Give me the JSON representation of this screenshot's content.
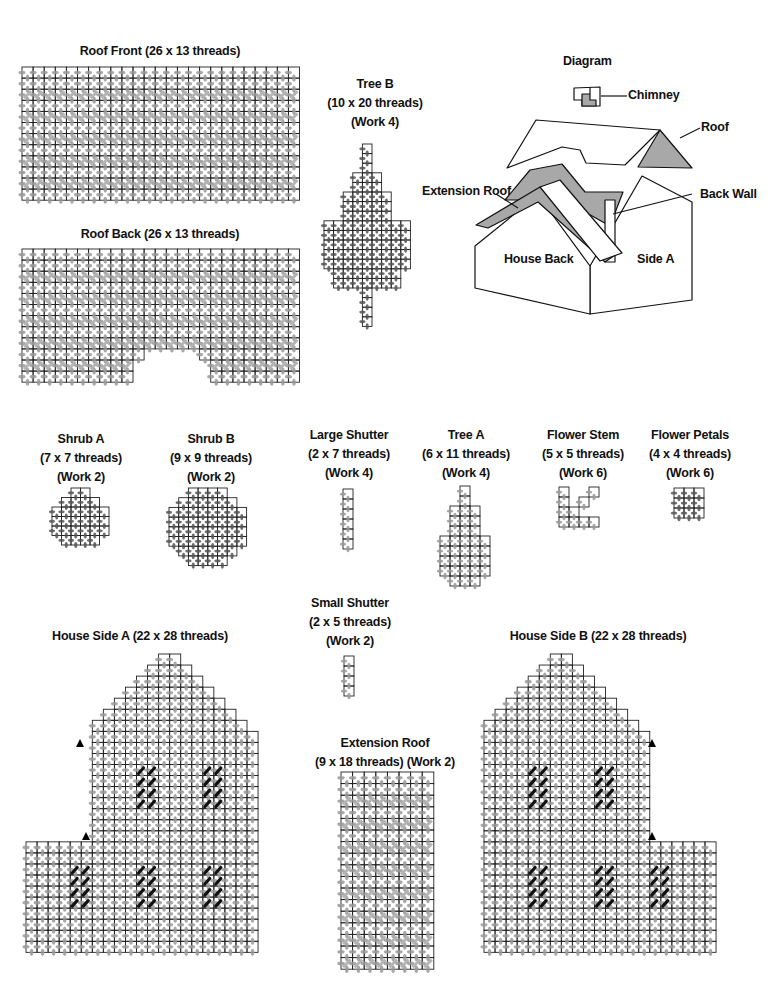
{
  "colors": {
    "grid_line": "#222222",
    "stitch_gray": "#9a9a9a",
    "stitch_dark": "#555555",
    "stitch_black": "#111111",
    "diagram_shade": "#a8a8a8"
  },
  "pieces": [
    {
      "id": "roof-front",
      "title": [
        "Roof Front (26 x 13 threads)"
      ],
      "label_x": 160,
      "label_y": 42,
      "grid": {
        "x": 22,
        "y": 67,
        "cell": 11.1,
        "cols": 25,
        "rows": 12,
        "shape": "rect",
        "hatched": true,
        "stitch": "gray"
      }
    },
    {
      "id": "roof-back",
      "title": [
        "Roof Back (26 x 13 threads)"
      ],
      "label_x": 160,
      "label_y": 225,
      "grid": {
        "x": 22,
        "y": 249,
        "cell": 11.1,
        "cols": 25,
        "rows": 12,
        "shape": "roofback",
        "hatched": true,
        "stitch": "gray"
      }
    },
    {
      "id": "tree-b",
      "title": [
        "Tree B",
        "(10 x 20 threads)",
        "(Work 4)"
      ],
      "label_x": 375,
      "label_y": 75,
      "grid": {
        "x": 324,
        "y": 144,
        "cell": 9.6,
        "cols": 9,
        "rows": 19,
        "shape": "treeb",
        "stitch": "dark"
      }
    },
    {
      "id": "shrub-a",
      "title": [
        "Shrub A",
        "(7 x 7 threads)",
        "(Work 2)"
      ],
      "label_x": 81,
      "label_y": 430,
      "grid": {
        "x": 52,
        "y": 488,
        "cell": 9.5,
        "cols": 6,
        "rows": 6,
        "shape": "shruba",
        "stitch": "dark"
      }
    },
    {
      "id": "shrub-b",
      "title": [
        "Shrub B",
        "(9 x 9 threads)",
        "(Work 2)"
      ],
      "label_x": 211,
      "label_y": 430,
      "grid": {
        "x": 169,
        "y": 488,
        "cell": 9.7,
        "cols": 8,
        "rows": 8,
        "shape": "shrubb",
        "stitch": "dark"
      }
    },
    {
      "id": "large-shutter",
      "title": [
        "Large Shutter",
        "(2 x 7 threads)",
        "(Work 4)"
      ],
      "label_x": 349,
      "label_y": 426,
      "grid": {
        "x": 343,
        "y": 489,
        "cell": 10,
        "cols": 1,
        "rows": 6,
        "shape": "rect",
        "stitch": "gray"
      }
    },
    {
      "id": "tree-a",
      "title": [
        "Tree A",
        "(6 x 11 threads)",
        "(Work 4)"
      ],
      "label_x": 466,
      "label_y": 426,
      "grid": {
        "x": 440,
        "y": 486,
        "cell": 10,
        "cols": 5,
        "rows": 10,
        "shape": "treea",
        "stitch": "gray"
      }
    },
    {
      "id": "flower-stem",
      "title": [
        "Flower Stem",
        "(5 x 5 threads)",
        "(Work 6)"
      ],
      "label_x": 583,
      "label_y": 426,
      "grid": {
        "x": 559,
        "y": 487,
        "cell": 10,
        "cols": 4,
        "rows": 4,
        "shape": "stem",
        "stitch": "gray"
      }
    },
    {
      "id": "flower-petals",
      "title": [
        "Flower Petals",
        "(4 x 4 threads)",
        "(Work 6)"
      ],
      "label_x": 690,
      "label_y": 426,
      "grid": {
        "x": 674,
        "y": 488,
        "cell": 10,
        "cols": 3,
        "rows": 3,
        "shape": "petals",
        "stitch": "dark"
      }
    },
    {
      "id": "small-shutter",
      "title": [
        "Small Shutter",
        "(2 x 5 threads)",
        "(Work 2)"
      ],
      "label_x": 350,
      "label_y": 594,
      "grid": {
        "x": 344,
        "y": 656,
        "cell": 10,
        "cols": 1,
        "rows": 4,
        "shape": "rect",
        "stitch": "gray"
      }
    },
    {
      "id": "extension-roof",
      "title": [
        "Extension Roof",
        "(9 x 18 threads) (Work 2)"
      ],
      "label_x": 385,
      "label_y": 734,
      "grid": {
        "x": 341,
        "y": 772,
        "cell": 11.6,
        "cols": 8,
        "rows": 17,
        "shape": "rect",
        "hatched": true,
        "stitch": "gray"
      }
    },
    {
      "id": "house-side-a",
      "title": [
        "House Side A (22 x 28 threads)"
      ],
      "label_x": 140,
      "label_y": 627,
      "grid": {
        "x": 26,
        "y": 654,
        "cell": 11.05,
        "cols": 21,
        "rows": 27,
        "shape": "housea",
        "stitch": "gray",
        "windows": "a"
      }
    },
    {
      "id": "house-side-b",
      "title": [
        "House Side B (22 x 28 threads)"
      ],
      "label_x": 598,
      "label_y": 627,
      "grid": {
        "x": 484,
        "y": 654,
        "cell": 11.05,
        "cols": 21,
        "rows": 27,
        "shape": "houseb",
        "stitch": "gray",
        "windows": "b"
      }
    }
  ],
  "diagram": {
    "title": "Diagram",
    "labels": {
      "chimney": "Chimney",
      "roof": "Roof",
      "extension_roof": "Extension Roof",
      "back_wall": "Back Wall",
      "house_back": "House Back",
      "side_a": "Side A"
    }
  }
}
